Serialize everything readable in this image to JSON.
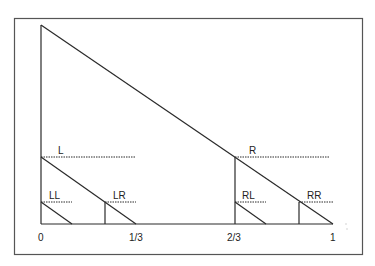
{
  "diagram": {
    "type": "recursive interval subdivision",
    "labels": {
      "L": "L",
      "LL": "LL",
      "LR": "LR",
      "R": "R",
      "RL": "RL",
      "RR": "RR"
    },
    "axis": {
      "ticks": [
        "0",
        "1/3",
        "2/3",
        "1"
      ]
    },
    "colors": {
      "line": "#2a2a2a",
      "frame": "#555555",
      "background": "#ffffff"
    }
  }
}
